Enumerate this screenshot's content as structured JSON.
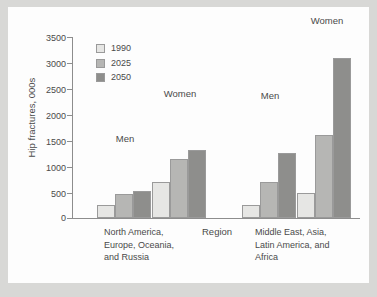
{
  "figure": {
    "background_color": "#d8d8d6",
    "panel_color": "#fdfdfd"
  },
  "chart_data": {
    "type": "bar",
    "title": "",
    "xlabel": "Region",
    "ylabel": "Hip fractures, 000s",
    "ylim": [
      0,
      3500
    ],
    "yticks": [
      0,
      500,
      1000,
      1500,
      2000,
      2500,
      3000,
      3500
    ],
    "ytick_labels": [
      "0",
      "500",
      "1000",
      "1500",
      "2000",
      "2500",
      "3000",
      "3500"
    ],
    "grid": false,
    "legend_position": "upper-left-inside",
    "categories": [
      "North America, Europe, Oceania, and Russia — Men",
      "North America, Europe, Oceania, and Russia — Women",
      "Middle East, Asia, Latin America, and Africa — Men",
      "Middle East, Asia, Latin America, and Africa — Women"
    ],
    "series": [
      {
        "name": "1990",
        "color": "#e6e6e4",
        "values": [
          250,
          700,
          250,
          480
        ]
      },
      {
        "name": "2025",
        "color": "#b6b6b4",
        "values": [
          470,
          1150,
          700,
          1600
        ]
      },
      {
        "name": "2050",
        "color": "#8e8e8c",
        "values": [
          530,
          1320,
          1250,
          3100
        ]
      }
    ],
    "group_annotations": [
      "Men",
      "Women",
      "Men",
      "Women"
    ],
    "region_labels": [
      "North America,\nEurope, Oceania,\nand Russia",
      "Middle East, Asia,\nLatin America, and\nAfrica"
    ]
  },
  "axis": {
    "y_title": "Hip fractures, 000s",
    "x_title": "Region",
    "tick_0": "0",
    "tick_500": "500",
    "tick_1000": "1000",
    "tick_1500": "1500",
    "tick_2000": "2000",
    "tick_2500": "2500",
    "tick_3000": "3000",
    "tick_3500": "3500"
  },
  "legend": {
    "items": [
      {
        "label": "1990",
        "color": "#e6e6e4"
      },
      {
        "label": "2025",
        "color": "#b6b6b4"
      },
      {
        "label": "2050",
        "color": "#8e8e8c"
      }
    ]
  },
  "annotations": {
    "group_1": "Men",
    "group_2": "Women",
    "group_3": "Men",
    "group_4": "Women"
  },
  "x_labels": {
    "left_line_1": "North America,",
    "left_line_2": "Europe, Oceania,",
    "left_line_3": "and Russia",
    "center": "Region",
    "right_line_1": "Middle East, Asia,",
    "right_line_2": "Latin America, and",
    "right_line_3": "Africa"
  }
}
